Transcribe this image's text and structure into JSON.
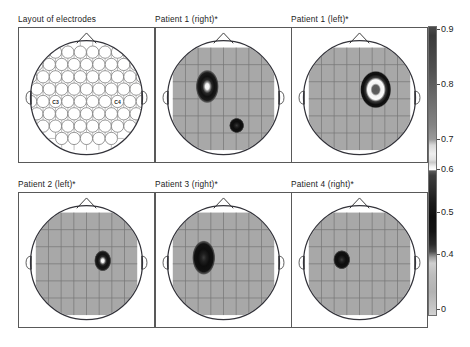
{
  "figure": {
    "width": 470,
    "height": 347,
    "background": "#ffffff"
  },
  "panels": [
    {
      "id": "layout-of-electrodes",
      "title": "Layout of electrodes",
      "kind": "electrode-layout",
      "x": 18,
      "y": 27,
      "w": 137,
      "h": 136,
      "electrode_labels": [
        "C3",
        "C4"
      ],
      "electrode_rows": [
        8,
        9,
        10,
        9,
        10,
        9,
        8,
        5
      ],
      "electrode_count": 68
    },
    {
      "id": "patient-1-right",
      "title": "Patient 1 (right)*",
      "kind": "heatmap",
      "x": 155,
      "y": 27,
      "w": 137,
      "h": 136,
      "blobs": [
        {
          "cx": 0.34,
          "cy": 0.38,
          "rx": 0.115,
          "ry": 0.165,
          "peak": 0.9,
          "core": "white"
        },
        {
          "cx": 0.63,
          "cy": 0.76,
          "rx": 0.075,
          "ry": 0.075,
          "peak": 0.62,
          "core": "dark"
        }
      ]
    },
    {
      "id": "patient-1-left",
      "title": "Patient 1 (left)*",
      "kind": "heatmap",
      "x": 291,
      "y": 27,
      "w": 137,
      "h": 136,
      "blobs": [
        {
          "cx": 0.66,
          "cy": 0.41,
          "rx": 0.155,
          "ry": 0.185,
          "peak": 0.9,
          "core": "ring"
        }
      ]
    },
    {
      "id": "patient-2-left",
      "title": "Patient 2 (left)*",
      "kind": "heatmap",
      "x": 18,
      "y": 192,
      "w": 137,
      "h": 136,
      "blobs": [
        {
          "cx": 0.66,
          "cy": 0.47,
          "rx": 0.085,
          "ry": 0.105,
          "peak": 0.9,
          "core": "white"
        }
      ]
    },
    {
      "id": "patient-3-right",
      "title": "Patient 3 (right)*",
      "kind": "heatmap",
      "x": 155,
      "y": 192,
      "w": 137,
      "h": 136,
      "blobs": [
        {
          "cx": 0.305,
          "cy": 0.44,
          "rx": 0.115,
          "ry": 0.17,
          "peak": 0.75,
          "core": "dark"
        }
      ]
    },
    {
      "id": "patient-4-right",
      "title": "Patient 4 (right)*",
      "kind": "heatmap",
      "x": 291,
      "y": 192,
      "w": 137,
      "h": 136,
      "blobs": [
        {
          "cx": 0.325,
          "cy": 0.46,
          "rx": 0.085,
          "ry": 0.095,
          "peak": 0.85,
          "core": "dark"
        }
      ]
    }
  ],
  "colorbar": {
    "orientation": "vertical",
    "ticks": [
      "0.9",
      "0.8",
      "0.7",
      "0.6",
      "0.5",
      "0.4",
      "0"
    ],
    "tick_values": [
      0.9,
      0.8,
      0.7,
      0.6,
      0.5,
      0.4,
      0
    ],
    "tick_offsets_px": [
      3,
      58,
      113,
      143,
      186,
      228,
      283
    ],
    "min_label": "0",
    "max_label": "0.9"
  },
  "chart_data": {
    "type": "heatmap",
    "title": "",
    "panel_titles": [
      "Layout of electrodes",
      "Patient 1 (right)*",
      "Patient 1 (left)*",
      "Patient 2 (left)*",
      "Patient 3 (right)*",
      "Patient 4 (right)*"
    ],
    "colorbar_ticks": [
      0.9,
      0.8,
      0.7,
      0.6,
      0.5,
      0.4,
      0
    ],
    "colorbar_range": [
      0,
      0.9
    ],
    "colormap": "grayscale-banded",
    "grid": true,
    "legend": "colorbar-right",
    "electrode_labels": [
      "C3",
      "C4"
    ],
    "series": [
      {
        "name": "Patient 1 (right)*",
        "hemisphere": "right",
        "foci": 2,
        "peak": 0.9
      },
      {
        "name": "Patient 1 (left)*",
        "hemisphere": "left",
        "foci": 1,
        "peak": 0.9
      },
      {
        "name": "Patient 2 (left)*",
        "hemisphere": "left",
        "foci": 1,
        "peak": 0.9
      },
      {
        "name": "Patient 3 (right)*",
        "hemisphere": "right",
        "foci": 1,
        "peak": 0.75
      },
      {
        "name": "Patient 4 (right)*",
        "hemisphere": "right",
        "foci": 1,
        "peak": 0.85
      }
    ]
  }
}
